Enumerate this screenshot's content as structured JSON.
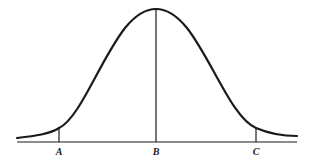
{
  "diagram": {
    "type": "normal-distribution-curve",
    "stroke_color": "#1a1a1a",
    "background": "#ffffff",
    "markers": [
      {
        "id": "A",
        "label": "A",
        "position": "left tail"
      },
      {
        "id": "B",
        "label": "B",
        "position": "mean / peak"
      },
      {
        "id": "C",
        "label": "C",
        "position": "right tail"
      }
    ]
  }
}
